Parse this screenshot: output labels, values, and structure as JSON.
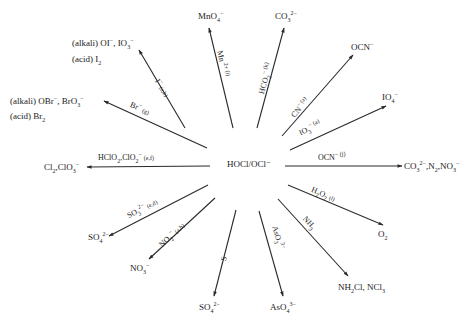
{
  "center": {
    "label": "HOCl/OCl⁻"
  },
  "colors": {
    "line": "#2a2a2a",
    "text": "#222222",
    "background": "#ffffff"
  },
  "reactions": [
    {
      "id": "iodide",
      "reagent": "I⁻ (a,b)",
      "products": [
        "(alkali) OI⁻, IO₃⁻",
        "(acid) I₂"
      ]
    },
    {
      "id": "manganese",
      "reagent": "Mn²⁺ (i)",
      "products": [
        "MnO₄⁻"
      ]
    },
    {
      "id": "formate",
      "reagent": "HCO₂⁻ (k)",
      "products": [
        "CO₃²⁻"
      ]
    },
    {
      "id": "cyanide",
      "reagent": "CN⁻ (a)",
      "products": [
        "OCN⁻"
      ]
    },
    {
      "id": "iodate",
      "reagent": "IO₃⁻ (a)",
      "products": [
        "IO₄⁻"
      ]
    },
    {
      "id": "bromide",
      "reagent": "Br⁻ (g)",
      "products": [
        "(alkali) OBr⁻, BrO₃⁻",
        "(acid) Br₂"
      ]
    },
    {
      "id": "chlorite",
      "reagent": "HClO₂, ClO₂⁻ (e,f)",
      "products": [
        "Cl₂, ClO₃⁻"
      ]
    },
    {
      "id": "cyanate",
      "reagent": "OCN⁻ (j)",
      "products": [
        "CO₃²⁻, N₂, NO₃⁻"
      ]
    },
    {
      "id": "sulfite",
      "reagent": "SO₃²⁻ (e,d)",
      "products": [
        "SO₄²⁻"
      ]
    },
    {
      "id": "nitrite",
      "reagent": "NO₂⁻ (a,b)",
      "products": [
        "NO₃⁻"
      ]
    },
    {
      "id": "sulfur",
      "reagent": "S",
      "products": [
        "SO₄²⁻"
      ]
    },
    {
      "id": "arsenite",
      "reagent": "AsO₃³⁻",
      "products": [
        "AsO₄³⁻"
      ]
    },
    {
      "id": "ammonia",
      "reagent": "NH₃",
      "products": [
        "NH₂Cl, NCl₃"
      ]
    },
    {
      "id": "peroxide",
      "reagent": "H₂O₂ (l)",
      "products": [
        "O₂"
      ]
    }
  ]
}
